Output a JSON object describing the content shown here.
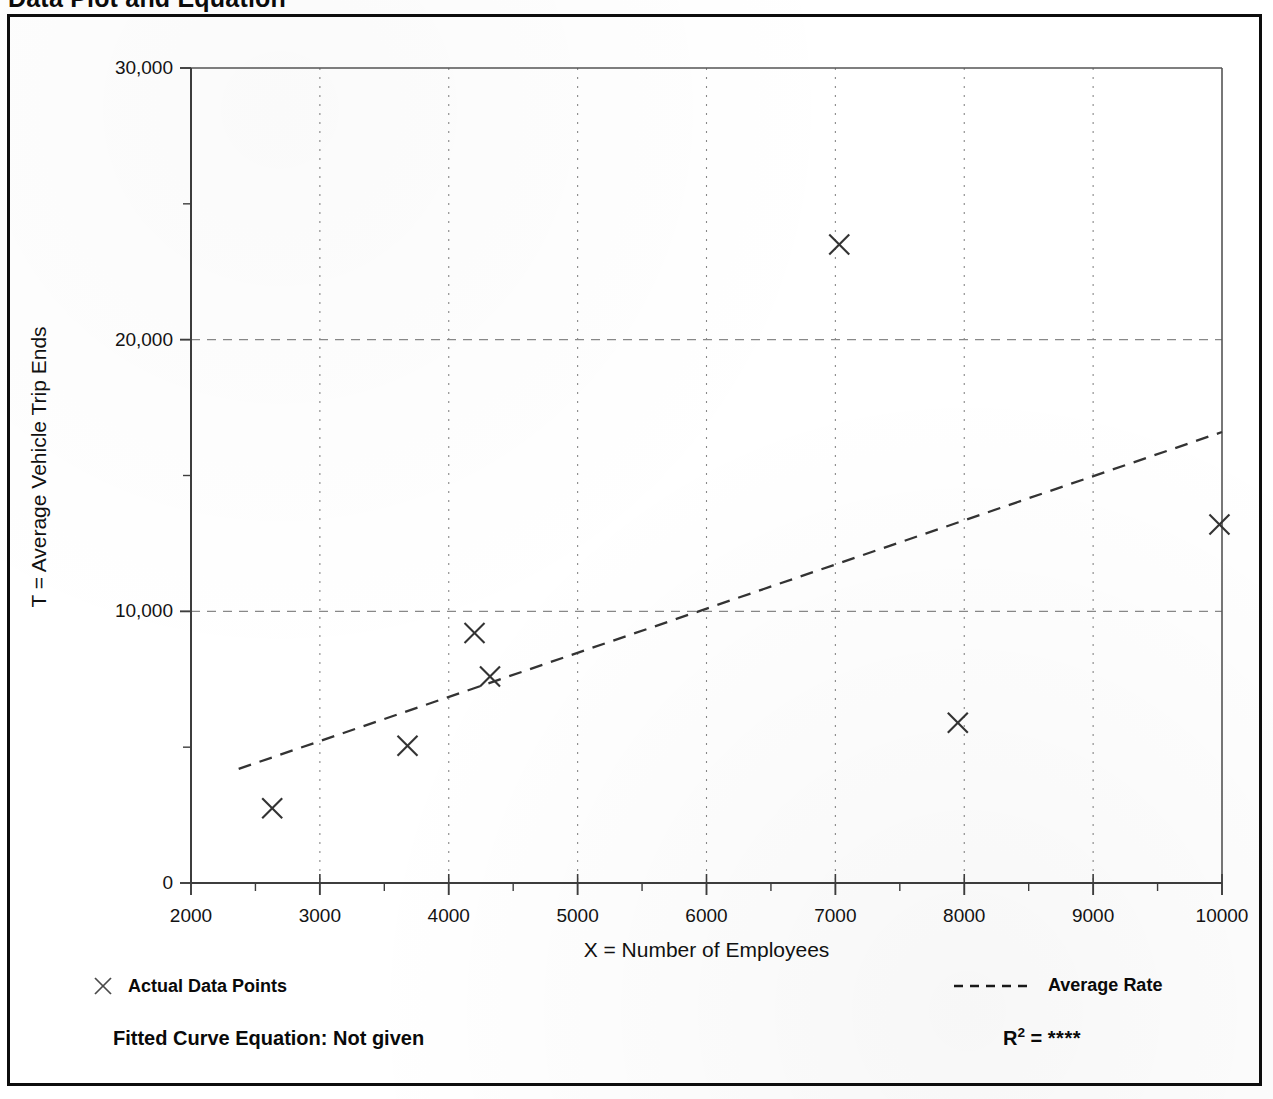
{
  "page": {
    "title": "Data Plot and Equation"
  },
  "chart_data": {
    "type": "scatter",
    "title": "Data Plot and Equation",
    "xlabel": "X = Number of Employees",
    "ylabel": "T = Average Vehicle Trip Ends",
    "xlim": [
      2000,
      10000
    ],
    "ylim": [
      0,
      30000
    ],
    "xticks": [
      2000,
      3000,
      4000,
      5000,
      6000,
      7000,
      8000,
      9000,
      10000
    ],
    "xtick_labels": [
      "2000",
      "3000",
      "4000",
      "5000",
      "6000",
      "7000",
      "8000",
      "9000",
      "10000"
    ],
    "xminor_step": 500,
    "yticks": [
      0,
      10000,
      20000,
      30000
    ],
    "ytick_labels": [
      "0",
      "10,000",
      "20,000",
      "30,000"
    ],
    "yminor_step": 5000,
    "grid": true,
    "grid_style": "dotted",
    "grid_color": "#888888",
    "legend_position": "below-axes",
    "series": [
      {
        "name": "Actual Data Points",
        "type": "scatter",
        "marker": "x",
        "color": "#333333",
        "points": [
          {
            "x": 2630,
            "y": 2750
          },
          {
            "x": 3680,
            "y": 5050
          },
          {
            "x": 4200,
            "y": 9200
          },
          {
            "x": 4320,
            "y": 7600
          },
          {
            "x": 7030,
            "y": 23500
          },
          {
            "x": 7950,
            "y": 5900
          },
          {
            "x": 9980,
            "y": 13200
          }
        ]
      },
      {
        "name": "Average Rate",
        "type": "line",
        "style": "dashed",
        "color": "#333333",
        "endpoints": [
          {
            "x": 2370,
            "y": 4200
          },
          {
            "x": 10000,
            "y": 16600
          }
        ]
      }
    ]
  },
  "axes": {
    "y_title": "T = Average Vehicle Trip Ends",
    "x_title": "X = Number of Employees",
    "y_tick_labels": [
      "30,000",
      "20,000",
      "10,000",
      "0"
    ],
    "x_tick_labels": [
      "2000",
      "3000",
      "4000",
      "5000",
      "6000",
      "7000",
      "8000",
      "9000",
      "10000"
    ]
  },
  "legend": {
    "data_points_label": "Actual Data Points",
    "average_rate_label": "Average Rate"
  },
  "footer": {
    "equation_label": "Fitted Curve Equation:  Not given",
    "r_squared_prefix": "R",
    "r_squared_exponent": "2",
    "r_squared_equals": " = ",
    "r_squared_value": "****"
  },
  "colors": {
    "ink": "#0a0a0a",
    "grid": "#888888",
    "axis": "#4a4a4a",
    "marker": "#333333",
    "background": "#ffffff"
  }
}
